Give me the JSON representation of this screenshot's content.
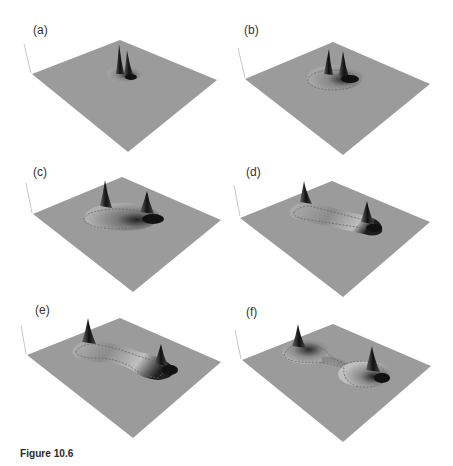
{
  "figure": {
    "caption": "Figure 10.6",
    "panels": [
      {
        "label": "(a)",
        "description": "flat surface with two closely spaced sharp peaks on a small mound"
      },
      {
        "label": "(b)",
        "description": "two peaks separating on a slightly wider circular mound with dashed contour"
      },
      {
        "label": "(c)",
        "description": "two peaks at ends of an elongated plateau with dashed contour"
      },
      {
        "label": "(d)",
        "description": "two peaks farther apart on an elongated ridge with dashed contour"
      },
      {
        "label": "(e)",
        "description": "two peaks connected by a curved narrowing ridge with dashed contour"
      },
      {
        "label": "(f)",
        "description": "two peaks on separate mounds joined by a narrow neck with dashed contour"
      }
    ]
  },
  "colors": {
    "surface": "#9a9a9a",
    "surface_edge": "#8a8a8a",
    "peak_dark": "#1a1a1a",
    "axis": "#c8c8c8"
  }
}
